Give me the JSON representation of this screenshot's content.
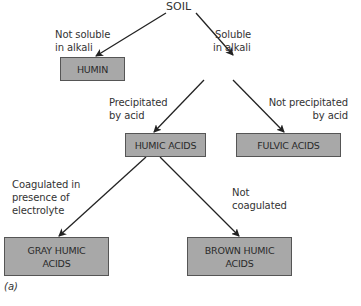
{
  "diagram": {
    "root": {
      "label": "SOIL"
    },
    "edges": {
      "soil_to_humin": "Not soluble\nin alkali",
      "soil_to_extract": "Soluble\nin alkali",
      "extract_to_humic": "Precipitated\nby acid",
      "extract_to_fulvic": "Not precipitated\nby acid",
      "humic_to_gray": "Coagulated in\npresence of\nelectrolyte",
      "humic_to_brown": "Not\ncoagulated"
    },
    "edge_lines": {
      "soil_to_humin": [
        "Not soluble",
        "in alkali"
      ],
      "soil_to_extract": [
        "Soluble",
        "in alkali"
      ],
      "extract_to_humic": [
        "Precipitated",
        "by acid"
      ],
      "extract_to_fulvic": [
        "Not precipitated",
        "by acid"
      ],
      "humic_to_gray": [
        "Coagulated in",
        "presence of",
        "electrolyte"
      ],
      "humic_to_brown": [
        "Not",
        "coagulated"
      ]
    },
    "nodes": {
      "humin": "HUMIN",
      "humic_acids": "HUMIC ACIDS",
      "fulvic_acids": "FULVIC ACIDS",
      "gray_humic": [
        "GRAY HUMIC",
        "ACIDS"
      ],
      "brown_humic": [
        "BROWN HUMIC",
        "ACIDS"
      ]
    },
    "caption": "(a)",
    "colors": {
      "box_fill": "#a8a8a8",
      "box_border": "#555555",
      "arrow": "#222222"
    }
  }
}
